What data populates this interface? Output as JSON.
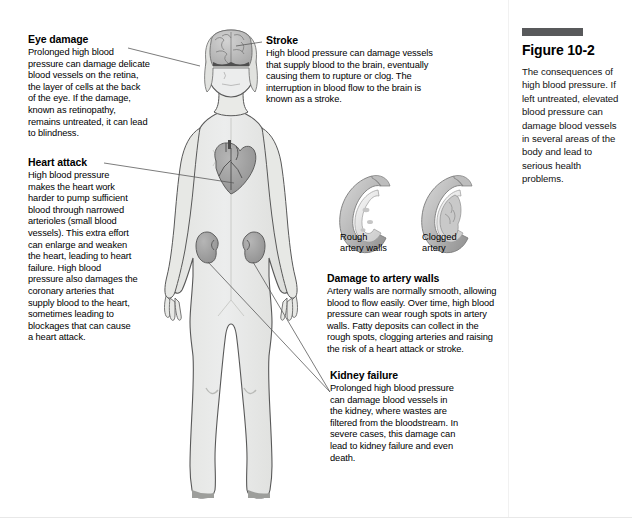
{
  "figure": {
    "number": "Figure 10-2",
    "caption": "The consequences of high blood pressure. If left untreated, elevated blood pressure can damage blood vessels in several areas of the body and lead to serious health problems.",
    "rule_color": "#58595b"
  },
  "callouts": [
    {
      "id": "eye-damage",
      "title": "Eye damage",
      "body": "Prolonged high blood pressure can damage delicate blood vessels on the retina, the layer of cells at the back of the eye. If the damage, known as retinopathy, remains untreated, it can lead to blindness."
    },
    {
      "id": "heart-attack",
      "title": "Heart attack",
      "body": "High blood pressure makes the heart work harder to pump sufficient blood through narrowed arterioles (small blood vessels). This extra effort can enlarge and weaken the heart, leading to heart failure. High blood pressure also damages the coronary arteries that supply blood to the heart, sometimes leading to blockages that can cause a heart attack."
    },
    {
      "id": "stroke",
      "title": "Stroke",
      "body": "High blood pressure can damage vessels that supply blood to the brain, eventually causing them to rupture or clog. The interruption in blood flow to the brain is known as a stroke."
    },
    {
      "id": "damage-to-artery-walls",
      "title": "Damage to artery walls",
      "body": "Artery walls are normally smooth, allowing blood to flow easily. Over time, high blood pressure can wear rough spots in artery walls. Fatty deposits can collect in the rough spots, clogging arteries and raising the risk of a heart attack or stroke."
    },
    {
      "id": "kidney-failure",
      "title": "Kidney failure",
      "body": "Prolonged high blood pressure can damage blood vessels in the kidney, where wastes are filtered from the bloodstream. In severe cases, this damage can lead to kidney failure and even death."
    }
  ],
  "artery_labels": [
    {
      "id": "rough-artery-walls",
      "line1": "Rough",
      "line2": "artery walls"
    },
    {
      "id": "clogged-artery",
      "line1": "Clogged",
      "line2": "artery"
    }
  ],
  "illustration": {
    "subject": "female human body anatomical silhouette",
    "organs": [
      "brain",
      "heart",
      "kidneys"
    ],
    "body_fill": "#e9eae7",
    "body_outline": "#4a4a4a",
    "organ_fill": "#9b9b9b",
    "leader_line_color": "#555555"
  }
}
